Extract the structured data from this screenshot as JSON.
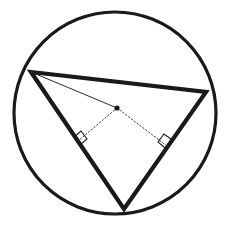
{
  "canvas": {
    "width": 231,
    "height": 225,
    "background_color": "#ffffff",
    "title": "Triangle inscribed in a circle with circumcenter and perpendicular bisectors"
  },
  "colors": {
    "stroke": "#1a1a1a",
    "thin_stroke": "#2b2b2b",
    "dotted_stroke": "#3a3a3a",
    "fill": "none",
    "background": "#ffffff"
  },
  "figure": {
    "circle": {
      "label": "circumscribed-circle",
      "cx": 115,
      "cy": 113,
      "r": 101,
      "stroke_width": 3.2,
      "fill": "none"
    },
    "triangle": {
      "label": "inscribed-triangle",
      "stroke_width": 4.2,
      "fill": "none",
      "vertices": [
        {
          "name": "vertex-left",
          "x": 31,
          "y": 72
        },
        {
          "name": "vertex-right",
          "x": 206,
          "y": 92
        },
        {
          "name": "vertex-bottom",
          "x": 124,
          "y": 209
        }
      ],
      "points_string": "31,72 206,92 124,209"
    },
    "center_point": {
      "label": "circumcenter-dot",
      "cx": 117,
      "cy": 108,
      "r": 2.6
    },
    "radius_segment": {
      "label": "radius-to-left-vertex",
      "x1": 31,
      "y1": 72,
      "x2": 117,
      "y2": 108,
      "stroke_width": 1.0,
      "style": "solid"
    },
    "perpendiculars": [
      {
        "label": "perpendicular-to-left-side",
        "x1": 117,
        "y1": 108,
        "x2": 78,
        "y2": 141,
        "stroke_width": 1.0,
        "style": "dotted",
        "dash_array": "1.4,2.2"
      },
      {
        "label": "perpendicular-to-right-side",
        "x1": 117,
        "y1": 108,
        "x2": 167,
        "y2": 146,
        "stroke_width": 1.0,
        "style": "dotted",
        "dash_array": "1.4,2.2"
      }
    ],
    "right_angle_marks": [
      {
        "label": "right-angle-mark-left",
        "points_string": "74,137 81,131 87,139 80,145",
        "stroke_width": 1.1
      },
      {
        "label": "right-angle-mark-right",
        "points_string": "171,139 164,134 158,142 165,148",
        "stroke_width": 1.1
      }
    ]
  }
}
